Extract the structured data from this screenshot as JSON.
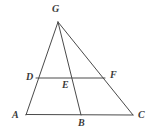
{
  "figure": {
    "type": "geometry-diagram",
    "background_color": "#ffffff",
    "stroke_color": "#4a4a4a",
    "label_color": "#3a3a3a",
    "stroke_width": 1,
    "points": [
      {
        "id": "G",
        "label": "G",
        "x": 58,
        "y": 22,
        "label_x": 52,
        "label_y": 4
      },
      {
        "id": "D",
        "label": "D",
        "x": 38,
        "y": 78,
        "label_x": 26,
        "label_y": 72
      },
      {
        "id": "E",
        "label": "E",
        "x": 72,
        "y": 78,
        "label_x": 62,
        "label_y": 80
      },
      {
        "id": "F",
        "label": "F",
        "x": 104,
        "y": 78,
        "label_x": 110,
        "label_y": 70
      },
      {
        "id": "A",
        "label": "A",
        "x": 26,
        "y": 115,
        "label_x": 12,
        "label_y": 110
      },
      {
        "id": "B",
        "label": "B",
        "x": 81,
        "y": 115,
        "label_x": 78,
        "label_y": 118
      },
      {
        "id": "C",
        "label": "C",
        "x": 133,
        "y": 115,
        "label_x": 138,
        "label_y": 110
      }
    ],
    "segments": [
      {
        "id": "GA",
        "from": "G",
        "to": "A",
        "x1": 58,
        "y1": 22,
        "x2": 26,
        "y2": 115
      },
      {
        "id": "GC",
        "from": "G",
        "to": "C",
        "x1": 58,
        "y1": 22,
        "x2": 133,
        "y2": 115
      },
      {
        "id": "GB",
        "from": "G",
        "to": "B",
        "x1": 58,
        "y1": 22,
        "x2": 81,
        "y2": 115
      },
      {
        "id": "AC",
        "from": "A",
        "to": "C",
        "x1": 26,
        "y1": 114.5,
        "x2": 133,
        "y2": 115
      },
      {
        "id": "DF",
        "from": "D",
        "to": "F",
        "x1": 36,
        "y1": 78,
        "x2": 105,
        "y2": 78
      }
    ]
  }
}
